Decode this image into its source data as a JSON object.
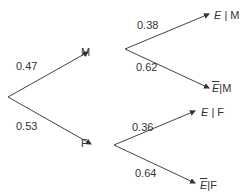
{
  "tree": {
    "root_branches": [
      {
        "node": "M",
        "prob": "0.47"
      },
      {
        "node": "F",
        "prob": "0.53"
      }
    ],
    "M_branches": [
      {
        "event": "E",
        "given": "M",
        "prob": "0.38",
        "complement": false
      },
      {
        "event": "E",
        "given": "M",
        "prob": "0.62",
        "complement": true
      }
    ],
    "F_branches": [
      {
        "event": "E",
        "given": "F",
        "prob": "0.36",
        "complement": false
      },
      {
        "event": "E",
        "given": "F",
        "prob": "0.64",
        "complement": true
      }
    ],
    "separator": "|",
    "line_color": "#333333"
  }
}
